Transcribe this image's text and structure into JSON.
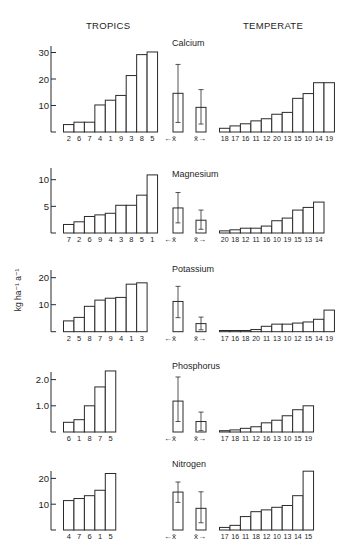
{
  "headers": {
    "left": "TROPICS",
    "right": "TEMPERATE",
    "y_axis_label": "kg ha⁻¹ a⁻¹"
  },
  "mean_labels": {
    "tropics": "←x̄",
    "temperate": "x̄→"
  },
  "chart_data": [
    {
      "type": "bar",
      "title": "Calcium",
      "ylabel": "kg ha-1 a-1",
      "yticks": [
        10,
        20,
        30
      ],
      "ytick_labels": [
        "10",
        "20",
        "30"
      ],
      "ylim": [
        0,
        33
      ],
      "tropics": {
        "categories": [
          "2",
          "6",
          "7",
          "4",
          "1",
          "9",
          "3",
          "8",
          "5"
        ],
        "values": [
          2.8,
          3.7,
          3.7,
          10.2,
          12.0,
          13.8,
          21.3,
          29.2,
          30.2
        ]
      },
      "temperate": {
        "categories": [
          "18",
          "17",
          "16",
          "11",
          "12",
          "20",
          "13",
          "15",
          "10",
          "14",
          "19"
        ],
        "values": [
          1.4,
          2.3,
          3.1,
          4.2,
          5.0,
          6.7,
          7.4,
          12.7,
          14.5,
          18.6,
          18.6
        ]
      },
      "mean_tropics": {
        "mean": 14.6,
        "low": 3.6,
        "high": 25.5
      },
      "mean_temperate": {
        "mean": 9.3,
        "low": 3.0,
        "high": 16.0
      }
    },
    {
      "type": "bar",
      "title": "Magnesium",
      "ylabel": "kg ha-1 a-1",
      "yticks": [
        5,
        10
      ],
      "ytick_labels": [
        "5",
        "10"
      ],
      "ylim": [
        0,
        12
      ],
      "tropics": {
        "categories": [
          "7",
          "2",
          "6",
          "9",
          "4",
          "3",
          "8",
          "5",
          "1"
        ],
        "values": [
          1.6,
          2.1,
          3.1,
          3.4,
          3.7,
          5.2,
          5.2,
          7.1,
          10.9
        ]
      },
      "temperate": {
        "categories": [
          "20",
          "18",
          "12",
          "11",
          "16",
          "10",
          "19",
          "15",
          "13",
          "14"
        ],
        "values": [
          0.4,
          0.6,
          0.9,
          0.9,
          1.3,
          2.3,
          2.8,
          4.3,
          4.8,
          5.8
        ]
      },
      "mean_tropics": {
        "mean": 4.7,
        "low": 1.9,
        "high": 7.6
      },
      "mean_temperate": {
        "mean": 2.4,
        "low": 0.7,
        "high": 4.3
      }
    },
    {
      "type": "bar",
      "title": "Potassium",
      "ylabel": "kg ha-1 a-1",
      "yticks": [
        10,
        20
      ],
      "ytick_labels": [
        "10",
        "20"
      ],
      "ylim": [
        0,
        22
      ],
      "tropics": {
        "categories": [
          "2",
          "5",
          "8",
          "7",
          "9",
          "4",
          "1",
          "3"
        ],
        "values": [
          4.0,
          5.3,
          9.4,
          11.7,
          12.4,
          12.7,
          17.6,
          18.1
        ]
      },
      "temperate": {
        "categories": [
          "17",
          "16",
          "18",
          "20",
          "11",
          "13",
          "10",
          "12",
          "15",
          "14",
          "19"
        ],
        "values": [
          0.4,
          0.4,
          0.4,
          0.8,
          2.0,
          2.8,
          2.8,
          3.2,
          3.6,
          4.6,
          8.0
        ]
      },
      "mean_tropics": {
        "mean": 11.2,
        "low": 5.2,
        "high": 16.8
      },
      "mean_temperate": {
        "mean": 3.0,
        "low": 0.7,
        "high": 5.4
      }
    },
    {
      "type": "bar",
      "title": "Phosphorus",
      "ylabel": "kg ha-1 a-1",
      "yticks": [
        1.0,
        2.0
      ],
      "ytick_labels": [
        "1.0",
        "2.0"
      ],
      "ylim": [
        0,
        2.5
      ],
      "tropics": {
        "categories": [
          "6",
          "1",
          "8",
          "7",
          "5"
        ],
        "values": [
          0.37,
          0.47,
          1.0,
          1.72,
          2.33
        ]
      },
      "temperate": {
        "categories": [
          "17",
          "18",
          "11",
          "12",
          "16",
          "13",
          "10",
          "15",
          "19"
        ],
        "values": [
          0.05,
          0.08,
          0.14,
          0.2,
          0.35,
          0.45,
          0.62,
          0.85,
          1.0
        ]
      },
      "mean_tropics": {
        "mean": 1.18,
        "low": 0.4,
        "high": 2.1
      },
      "mean_temperate": {
        "mean": 0.4,
        "low": 0.05,
        "high": 0.76
      }
    },
    {
      "type": "bar",
      "title": "Nitrogen",
      "ylabel": "kg ha-1 a-1",
      "yticks": [
        10,
        20
      ],
      "ytick_labels": [
        "10",
        "20"
      ],
      "ylim": [
        0,
        24
      ],
      "tropics": {
        "categories": [
          "4",
          "7",
          "6",
          "1",
          "5"
        ],
        "values": [
          11.4,
          12.2,
          13.3,
          15.4,
          21.9
        ]
      },
      "temperate": {
        "categories": [
          "17",
          "16",
          "11",
          "18",
          "12",
          "10",
          "13",
          "14",
          "15"
        ],
        "values": [
          1.0,
          1.8,
          5.2,
          7.1,
          7.8,
          8.8,
          9.5,
          13.3,
          22.8
        ]
      },
      "mean_tropics": {
        "mean": 14.7,
        "low": 10.7,
        "high": 18.6
      },
      "mean_temperate": {
        "mean": 8.4,
        "low": 2.8,
        "high": 14.8
      }
    }
  ]
}
